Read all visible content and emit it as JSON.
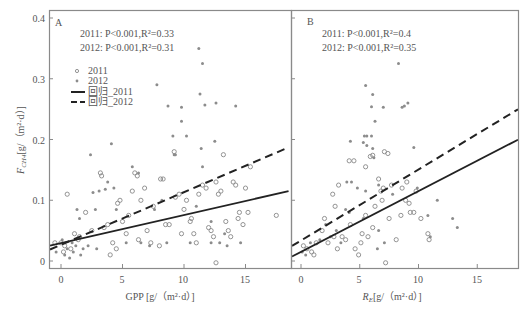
{
  "chart_data": [
    {
      "panel": "A",
      "type": "scatter",
      "xlabel": "GPP [g/（m²·d）]",
      "ylabel": "F_CH4 [g/（m²·d）]",
      "xlim": [
        -1,
        18.5
      ],
      "ylim": [
        -0.005,
        0.41
      ],
      "xticks": [
        0,
        5,
        10,
        15
      ],
      "yticks": [
        0,
        0.1,
        0.2,
        0.3,
        0.4
      ],
      "annotations": [
        "2011: P<0.001,R²=0.33",
        "2012: P<0.001,R²=0.31"
      ],
      "legend": [
        "2011",
        "2012",
        "回归_2011",
        "回归_2012"
      ],
      "regression": {
        "2011": {
          "x": [
            -1,
            18.5
          ],
          "y": [
            0.025,
            0.115
          ],
          "style": "solid"
        },
        "2012": {
          "x": [
            -1,
            18.5
          ],
          "y": [
            0.018,
            0.187
          ],
          "style": "dashed"
        }
      },
      "series": [
        {
          "name": "2011",
          "marker": "open-circle",
          "points": [
            [
              0.5,
              0.11
            ],
            [
              1.1,
              0.045
            ],
            [
              1.4,
              0.035
            ],
            [
              0,
              0.03
            ],
            [
              -0.5,
              0.03
            ],
            [
              0.3,
              0.025
            ],
            [
              0.8,
              0.02
            ],
            [
              0.2,
              0.015
            ],
            [
              1.5,
              0.04
            ],
            [
              2,
              0.08
            ],
            [
              3.2,
              0.145
            ],
            [
              3.3,
              0.14
            ],
            [
              3.8,
              0.06
            ],
            [
              4.2,
              0.03
            ],
            [
              4.5,
              0.02
            ],
            [
              4.8,
              0.1
            ],
            [
              4.6,
              0.095
            ],
            [
              5,
              0.065
            ],
            [
              5.5,
              0.075
            ],
            [
              5.8,
              0.115
            ],
            [
              6,
              0.145
            ],
            [
              6.2,
              0.14
            ],
            [
              6.5,
              0.1
            ],
            [
              6.8,
              0.12
            ],
            [
              7,
              0.05
            ],
            [
              7.3,
              0.03
            ],
            [
              7.5,
              0.09
            ],
            [
              8.1,
              0.135
            ],
            [
              8.3,
              0.135
            ],
            [
              8.5,
              0.06
            ],
            [
              8.8,
              0.06
            ],
            [
              9.2,
              0.18
            ],
            [
              9.3,
              0.105
            ],
            [
              9.6,
              0.11
            ],
            [
              10,
              0.085
            ],
            [
              10.2,
              0.1
            ],
            [
              10.5,
              0.065
            ],
            [
              10.8,
              0.045
            ],
            [
              11,
              0.03
            ],
            [
              11.2,
              0.11
            ],
            [
              11.5,
              0.125
            ],
            [
              11.8,
              0.12
            ],
            [
              12,
              0.055
            ],
            [
              12.2,
              0.05
            ],
            [
              12.4,
              0.04
            ],
            [
              12.6,
              0.13
            ],
            [
              12.8,
              0.11
            ],
            [
              13,
              0.115
            ],
            [
              13.2,
              0.175
            ],
            [
              13.4,
              0.065
            ],
            [
              13.6,
              0.05
            ],
            [
              14,
              0.13
            ],
            [
              14.2,
              0.125
            ],
            [
              14.4,
              0.07
            ],
            [
              14.5,
              0.08
            ],
            [
              14.8,
              0.06
            ],
            [
              15,
              0.12
            ],
            [
              15.2,
              0.08
            ],
            [
              15.4,
              0.155
            ],
            [
              17.5,
              0.075
            ],
            [
              12.6,
              -0.003
            ],
            [
              8,
              0.025
            ],
            [
              6.3,
              0.035
            ],
            [
              5.3,
              0.045
            ],
            [
              2.5,
              0.05
            ],
            [
              3.5,
              0.055
            ],
            [
              9.8,
              0.045
            ],
            [
              10.6,
              0.07
            ],
            [
              13.8,
              0.04
            ],
            [
              4,
              0.01
            ]
          ]
        },
        {
          "name": "2012",
          "marker": "filled-dot",
          "points": [
            [
              11.2,
              0.35
            ],
            [
              11.5,
              0.325
            ],
            [
              7.8,
              0.29
            ],
            [
              11.3,
              0.275
            ],
            [
              8.7,
              0.255
            ],
            [
              9.8,
              0.253
            ],
            [
              11.7,
              0.257
            ],
            [
              12.6,
              0.26
            ],
            [
              14.2,
              0.255
            ],
            [
              9.8,
              0.23
            ],
            [
              9.1,
              0.206
            ],
            [
              10.2,
              0.206
            ],
            [
              4.1,
              0.193
            ],
            [
              12.5,
              0.197
            ],
            [
              11.4,
              0.185
            ],
            [
              2.4,
              0.175
            ],
            [
              9.2,
              0.175
            ],
            [
              3.8,
              0.13
            ],
            [
              2.6,
              0.113
            ],
            [
              3.1,
              0.115
            ],
            [
              3.6,
              0.118
            ],
            [
              4.3,
              0.12
            ],
            [
              1.3,
              0.085
            ],
            [
              1.5,
              0.07
            ],
            [
              2.8,
              0.085
            ],
            [
              4.5,
              0.085
            ],
            [
              5.8,
              0.155
            ],
            [
              6.3,
              0.145
            ],
            [
              9.3,
              0.175
            ],
            [
              11.5,
              0.155
            ],
            [
              12.2,
              0.065
            ],
            [
              12.9,
              0.03
            ],
            [
              10.5,
              0.03
            ],
            [
              8.6,
              0.03
            ],
            [
              7.2,
              0.025
            ],
            [
              13.5,
              0.025
            ],
            [
              14.6,
              0.03
            ],
            [
              6.5,
              0.03
            ],
            [
              5.3,
              0.03
            ],
            [
              2.9,
              0.02
            ],
            [
              0.3,
              0.01
            ],
            [
              0.5,
              0.02
            ],
            [
              0.7,
              0.005
            ],
            [
              1,
              0.015
            ],
            [
              1.2,
              0.025
            ],
            [
              0.1,
              0.035
            ],
            [
              -0.4,
              0.015
            ],
            [
              0.9,
              0.03
            ],
            [
              1.6,
              0.01
            ],
            [
              1.8,
              0.02
            ],
            [
              2.2,
              0.025
            ],
            [
              12.2,
              0.03
            ],
            [
              11,
              0.09
            ],
            [
              13.3,
              0.045
            ],
            [
              8.2,
              0.1
            ],
            [
              7.6,
              0.085
            ]
          ]
        }
      ]
    },
    {
      "panel": "B",
      "type": "scatter",
      "xlabel": "R_E [g/（m²·d）]",
      "ylabel": "",
      "xlim": [
        -1,
        18.5
      ],
      "ylim": [
        -0.005,
        0.41
      ],
      "xticks": [
        0,
        5,
        10,
        15
      ],
      "yticks": [
        0,
        0.1,
        0.2,
        0.3,
        0.4
      ],
      "annotations": [
        "2011: P<0.001,R²=0.4",
        "2012: P<0.001,R²=0.35"
      ],
      "regression": {
        "2011": {
          "x": [
            -1,
            18.5
          ],
          "y": [
            0.005,
            0.2
          ],
          "style": "solid"
        },
        "2012": {
          "x": [
            -1,
            18.5
          ],
          "y": [
            0.022,
            0.25
          ],
          "style": "dashed"
        }
      },
      "series": [
        {
          "name": "2011",
          "marker": "open-circle",
          "points": [
            [
              6.1,
              0.174
            ],
            [
              5.9,
              0.172
            ],
            [
              7.1,
              0.18
            ],
            [
              7.4,
              0.177
            ],
            [
              4.5,
              0.165
            ],
            [
              4.1,
              0.165
            ],
            [
              5.5,
              0.155
            ],
            [
              2.7,
              0.11
            ],
            [
              3.2,
              0.125
            ],
            [
              2.9,
              0.09
            ],
            [
              2,
              0.07
            ],
            [
              1.8,
              0.05
            ],
            [
              2.8,
              0.04
            ],
            [
              3.8,
              0.035
            ],
            [
              4.2,
              0.06
            ],
            [
              4.6,
              0.02
            ],
            [
              5.2,
              0.045
            ],
            [
              5.5,
              0.075
            ],
            [
              6.3,
              0.09
            ],
            [
              6.8,
              0.115
            ],
            [
              7,
              0.12
            ],
            [
              7.5,
              0.07
            ],
            [
              8.1,
              0.035
            ],
            [
              8.5,
              0.075
            ],
            [
              8.9,
              0.1
            ],
            [
              9,
              0.13
            ],
            [
              9.3,
              0.08
            ],
            [
              9.6,
              0.08
            ],
            [
              10.2,
              0.07
            ],
            [
              10.8,
              0.045
            ],
            [
              10.9,
              0.035
            ],
            [
              9.8,
              0.115
            ],
            [
              6.6,
              0.135
            ],
            [
              6.9,
              0.1
            ],
            [
              7.7,
              0.125
            ],
            [
              8.6,
              0.12
            ],
            [
              4.9,
              0.01
            ],
            [
              5.1,
              0.03
            ],
            [
              3.5,
              0.04
            ],
            [
              0.2,
              0.025
            ],
            [
              0.5,
              0.02
            ],
            [
              0.9,
              0.015
            ],
            [
              1.3,
              0.03
            ],
            [
              1.1,
              0.01
            ],
            [
              2.3,
              0.03
            ],
            [
              3.1,
              0.02
            ],
            [
              6.1,
              0.055
            ],
            [
              7.2,
              -0.003
            ],
            [
              5.7,
              0.04
            ],
            [
              9.2,
              0.095
            ]
          ]
        },
        {
          "name": "2012",
          "marker": "filled-dot",
          "points": [
            [
              8.3,
              0.325
            ],
            [
              5.5,
              0.289
            ],
            [
              6.1,
              0.274
            ],
            [
              9.1,
              0.26
            ],
            [
              6,
              0.254
            ],
            [
              7,
              0.253
            ],
            [
              8.8,
              0.255
            ],
            [
              8.6,
              0.253
            ],
            [
              6.3,
              0.23
            ],
            [
              5.6,
              0.206
            ],
            [
              5.4,
              0.206
            ],
            [
              6,
              0.206
            ],
            [
              4.2,
              0.197
            ],
            [
              5.3,
              0.195
            ],
            [
              5.6,
              0.19
            ],
            [
              9.6,
              0.187
            ],
            [
              6.1,
              0.185
            ],
            [
              6.2,
              0.17
            ],
            [
              3.9,
              0.13
            ],
            [
              4.3,
              0.13
            ],
            [
              4.8,
              0.12
            ],
            [
              5.5,
              0.115
            ],
            [
              6.6,
              0.125
            ],
            [
              3.8,
              0.085
            ],
            [
              4.1,
              0.08
            ],
            [
              5.3,
              0.07
            ],
            [
              6.6,
              0.05
            ],
            [
              10.8,
              0.075
            ],
            [
              11.6,
              0.1
            ],
            [
              12.9,
              0.07
            ],
            [
              13.3,
              0.055
            ],
            [
              11,
              0.04
            ],
            [
              7.1,
              0.03
            ],
            [
              6.5,
              0.02
            ],
            [
              3.4,
              0.03
            ],
            [
              2.5,
              0.04
            ],
            [
              1.6,
              0.035
            ],
            [
              0.4,
              0.01
            ],
            [
              0.8,
              0.03
            ],
            [
              0.1,
              0.015
            ],
            [
              3,
              0.05
            ],
            [
              2.1,
              0.06
            ],
            [
              9.9,
              0.12
            ],
            [
              7.8,
              0.11
            ]
          ]
        }
      ]
    }
  ],
  "panels": {
    "A": {
      "label": "A",
      "stat_2011": "2011: P<0.001,R²=0.33",
      "stat_2012": "2012: P<0.001,R²=0.31",
      "xlabel": "GPP [g/（m²·d）]"
    },
    "B": {
      "label": "B",
      "stat_2011": "2011: P<0.001,R²=0.4",
      "stat_2012": "2012: P<0.001,R²=0.35",
      "xlabel_main": "R",
      "xlabel_sub": "E",
      "xlabel_rest": "[g/（m²·d）]"
    }
  },
  "yaxis": {
    "label_main": "F",
    "label_sub": "CH4",
    "label_rest": "[g/（m²·d）]",
    "ticks": [
      "0",
      "0.1",
      "0.2",
      "0.3",
      "0.4"
    ]
  },
  "xaxis": {
    "ticks": [
      "0",
      "5",
      "10",
      "15"
    ]
  },
  "legend": {
    "items": [
      {
        "label": "2011",
        "marker": "open-circle"
      },
      {
        "label": "2012",
        "marker": "filled-dot"
      },
      {
        "label": "回归_2011",
        "marker": "solid-line"
      },
      {
        "label": "回归_2012",
        "marker": "dashed-line"
      }
    ]
  },
  "colors": {
    "axis": "#8a8a8a",
    "point_2011": "#888888",
    "point_2012": "#8c8c8c",
    "regression": "#222222",
    "text": "#555555"
  }
}
